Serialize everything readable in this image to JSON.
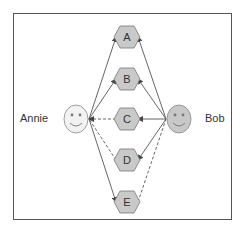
{
  "diagram": {
    "people": [
      {
        "id": "annie",
        "label": "Annie",
        "fill": "#f2f2f2",
        "cx": 76,
        "cy": 119
      },
      {
        "id": "bob",
        "label": "Bob",
        "fill": "#c8c8c8",
        "cx": 179,
        "cy": 119
      }
    ],
    "nodes": [
      {
        "id": "A",
        "label": "A",
        "cx": 127,
        "cy": 37
      },
      {
        "id": "B",
        "label": "B",
        "cx": 127,
        "cy": 79
      },
      {
        "id": "C",
        "label": "C",
        "cx": 127,
        "cy": 119
      },
      {
        "id": "D",
        "label": "D",
        "cx": 127,
        "cy": 160
      },
      {
        "id": "E",
        "label": "E",
        "cx": 127,
        "cy": 202
      }
    ],
    "edges": [
      {
        "from": "annie",
        "to": "A",
        "style": "solid",
        "arrow": "end"
      },
      {
        "from": "annie",
        "to": "B",
        "style": "solid",
        "arrow": "end"
      },
      {
        "from": "C",
        "to": "annie",
        "style": "dashed",
        "arrow": "end"
      },
      {
        "from": "D",
        "to": "annie",
        "style": "dashed",
        "arrow": "none"
      },
      {
        "from": "annie",
        "to": "E",
        "style": "solid",
        "arrow": "end"
      },
      {
        "from": "bob",
        "to": "A",
        "style": "solid",
        "arrow": "end"
      },
      {
        "from": "bob",
        "to": "B",
        "style": "solid",
        "arrow": "end"
      },
      {
        "from": "bob",
        "to": "C",
        "style": "solid",
        "arrow": "end"
      },
      {
        "from": "bob",
        "to": "D",
        "style": "solid",
        "arrow": "end"
      },
      {
        "from": "E",
        "to": "bob",
        "style": "dashed",
        "arrow": "none"
      }
    ],
    "colors": {
      "node_fill": "#c9c9c9",
      "node_stroke": "#777777",
      "edge": "#555555",
      "frame": "#555555"
    }
  }
}
